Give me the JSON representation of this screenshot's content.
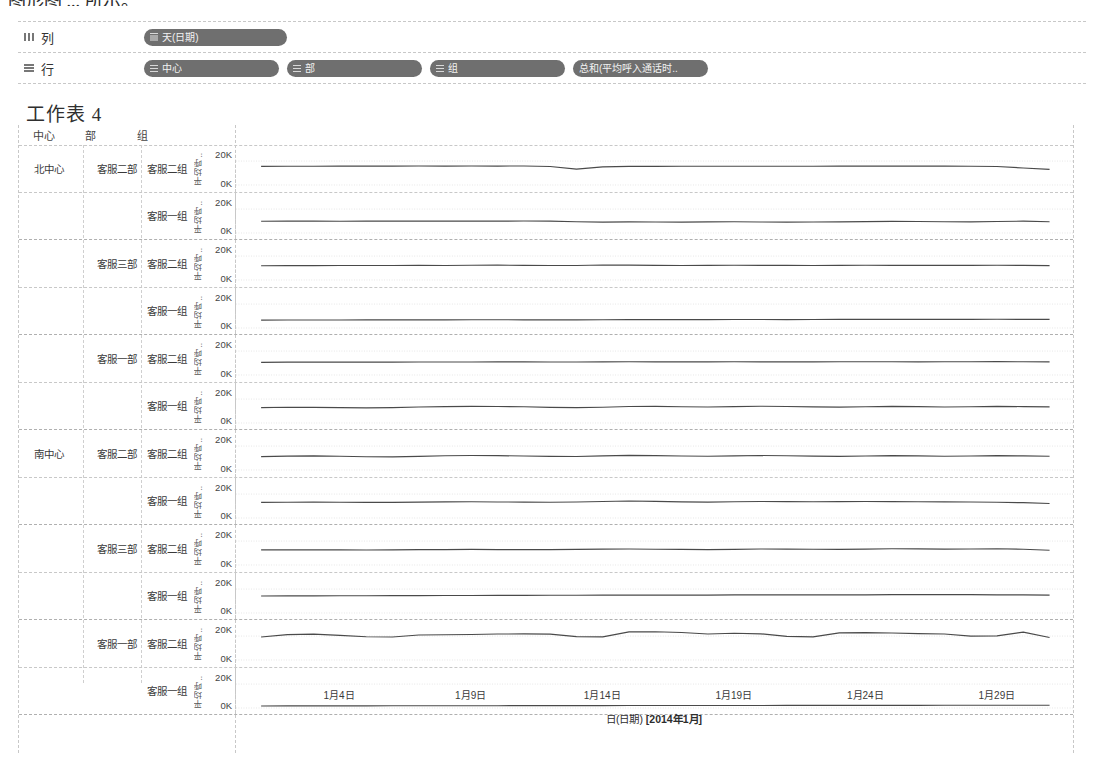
{
  "top_cut_text": "图形图 ... 所示。",
  "shelf": {
    "columns": {
      "label": "列",
      "icon": "columns-grid-icon",
      "pills": [
        {
          "icon": "calendar-icon",
          "text": "天(日期)"
        }
      ]
    },
    "rows": {
      "label": "行",
      "icon": "rows-grid-icon",
      "pills": [
        {
          "icon": "dimension-icon",
          "text": "中心"
        },
        {
          "icon": "dimension-icon",
          "text": "部"
        },
        {
          "icon": "dimension-icon",
          "text": "组"
        },
        {
          "icon": "measure-icon",
          "text": "总和(平均呼入通话时.."
        }
      ]
    }
  },
  "worksheet": {
    "title": "工作表 4"
  },
  "headers": {
    "center": "中心",
    "dept": "部",
    "group": "组"
  },
  "axis": {
    "y_title": "平均呼..",
    "y_ticks": [
      "20K",
      "0K"
    ],
    "x_ticks": [
      "1月4日",
      "1月9日",
      "1月14日",
      "1月19日",
      "1月24日",
      "1月29日"
    ],
    "x_title_main": "日(日期) ",
    "x_title_bold": "[2014年1月]"
  },
  "chart_data": {
    "type": "line",
    "title": "工作表 4",
    "xlabel": "日(日期) [2014年1月]",
    "ylabel": "平均呼入通话时长",
    "ylim": [
      0,
      28000
    ],
    "y_ticks": [
      0,
      20000
    ],
    "grid": true,
    "legend": "none",
    "x": [
      "1月1日",
      "1月2日",
      "1月3日",
      "1月4日",
      "1月5日",
      "1月6日",
      "1月7日",
      "1月8日",
      "1月9日",
      "1月10日",
      "1月11日",
      "1月12日",
      "1月13日",
      "1月14日",
      "1月15日",
      "1月16日",
      "1月17日",
      "1月18日",
      "1月19日",
      "1月20日",
      "1月21日",
      "1月22日",
      "1月23日",
      "1月24日",
      "1月25日",
      "1月26日",
      "1月27日",
      "1月28日",
      "1月29日",
      "1月30日",
      "1月31日"
    ],
    "panels": [
      {
        "center": "北中心",
        "dept": "客服二部",
        "group": "客服二组",
        "values": [
          15600,
          15700,
          15700,
          15750,
          15800,
          15800,
          15850,
          15800,
          15850,
          15800,
          15900,
          15500,
          13300,
          15200,
          15600,
          15600,
          15700,
          15700,
          15700,
          15700,
          15700,
          15700,
          15800,
          15800,
          15800,
          15800,
          15800,
          15700,
          15500,
          14200,
          13000
        ]
      },
      {
        "center": "北中心",
        "dept": "客服二部",
        "group": "客服一组",
        "values": [
          9800,
          9900,
          9900,
          9850,
          9900,
          9900,
          9950,
          9900,
          9900,
          9950,
          10000,
          9900,
          9400,
          9100,
          9300,
          9200,
          9100,
          9300,
          9400,
          9200,
          9100,
          9200,
          9300,
          9500,
          9700,
          9600,
          9400,
          9300,
          9600,
          9900,
          9400
        ]
      },
      {
        "center": "北中心",
        "dept": "客服三部",
        "group": "客服二组",
        "values": [
          11900,
          12000,
          12000,
          12100,
          12100,
          12150,
          12200,
          12150,
          12300,
          12400,
          12250,
          12150,
          12100,
          12500,
          12400,
          12200,
          12150,
          12200,
          12300,
          12250,
          12200,
          12150,
          12200,
          12300,
          12250,
          12200,
          12200,
          12250,
          12300,
          12200,
          12000
        ]
      },
      {
        "center": "北中心",
        "dept": "客服三部",
        "group": "客服一组",
        "values": [
          6600,
          6650,
          6700,
          6700,
          6750,
          6800,
          6800,
          6850,
          6900,
          6900,
          6850,
          6800,
          6800,
          6900,
          6950,
          7000,
          7000,
          7050,
          7100,
          7100,
          7050,
          7100,
          7150,
          7200,
          7200,
          7150,
          7200,
          7250,
          7300,
          7250,
          7200
        ]
      },
      {
        "center": "北中心",
        "dept": "客服一部",
        "group": "客服二组",
        "values": [
          10600,
          10700,
          10750,
          10750,
          10800,
          10800,
          10850,
          10900,
          10900,
          10950,
          11000,
          10900,
          10850,
          11000,
          11100,
          11000,
          10950,
          11000,
          11050,
          11000,
          10950,
          11000,
          11100,
          11100,
          11050,
          11000,
          11050,
          11100,
          11150,
          11100,
          11000
        ]
      },
      {
        "center": "北中心",
        "dept": "客服一部",
        "group": "客服一组",
        "values": [
          12800,
          13200,
          13100,
          12900,
          12700,
          12900,
          13400,
          13700,
          13900,
          13800,
          13600,
          13100,
          12900,
          13200,
          13800,
          13900,
          13600,
          13400,
          13700,
          14000,
          13800,
          13500,
          13300,
          13600,
          13900,
          13700,
          13400,
          13600,
          13900,
          13700,
          13500
        ]
      },
      {
        "center": "南中心",
        "dept": "客服二部",
        "group": "客服二组",
        "values": [
          11200,
          11600,
          11800,
          11500,
          11100,
          11000,
          11400,
          11900,
          12100,
          12000,
          11700,
          11400,
          11300,
          11800,
          12200,
          12000,
          11700,
          11500,
          11800,
          12100,
          11900,
          11600,
          11400,
          11700,
          12000,
          11800,
          11500,
          11700,
          12000,
          11800,
          11500
        ]
      },
      {
        "center": "南中心",
        "dept": "客服二部",
        "group": "客服一组",
        "values": [
          13000,
          13200,
          13300,
          13200,
          13100,
          13100,
          13300,
          13500,
          13600,
          13400,
          13300,
          13200,
          13400,
          13800,
          14200,
          13900,
          13500,
          13300,
          13600,
          13800,
          13700,
          13600,
          13700,
          13800,
          13700,
          13600,
          13500,
          13400,
          13200,
          12800,
          12100
        ]
      },
      {
        "center": "南中心",
        "dept": "客服三部",
        "group": "客服二组",
        "values": [
          12600,
          12700,
          12700,
          12600,
          12500,
          12600,
          12800,
          12900,
          13000,
          12900,
          12800,
          12900,
          13100,
          13300,
          13400,
          13200,
          13000,
          12900,
          13100,
          13400,
          13300,
          13200,
          13100,
          13300,
          13600,
          13500,
          13300,
          13400,
          13600,
          13200,
          12300
        ]
      },
      {
        "center": "南中心",
        "dept": "客服三部",
        "group": "客服一组",
        "values": [
          14200,
          14300,
          14300,
          14400,
          14400,
          14500,
          14500,
          14600,
          14600,
          14700,
          14700,
          14800,
          14800,
          14900,
          14900,
          15000,
          15000,
          15000,
          15100,
          15100,
          15100,
          15200,
          15200,
          15200,
          15300,
          15300,
          15300,
          15300,
          15200,
          15100,
          14900
        ]
      },
      {
        "center": "南中心",
        "dept": "客服一部",
        "group": "客服二组",
        "values": [
          19200,
          21200,
          21600,
          20600,
          19400,
          19200,
          20900,
          21100,
          21300,
          21700,
          21800,
          21600,
          19600,
          19300,
          23500,
          23600,
          23000,
          21700,
          22400,
          21900,
          19800,
          19300,
          22700,
          22900,
          22600,
          22000,
          21700,
          19900,
          20200,
          23300,
          18800
        ]
      },
      {
        "center": "南中心",
        "dept": "客服一部",
        "group": "客服一组",
        "values": [
          1700,
          1750,
          1750,
          1800,
          1800,
          1850,
          1850,
          1900,
          1900,
          1900,
          1950,
          1950,
          2000,
          2000,
          2050,
          2050,
          2050,
          2100,
          2100,
          2100,
          2150,
          2150,
          2150,
          2200,
          2200,
          2200,
          2250,
          2250,
          2250,
          2300,
          2300
        ]
      }
    ]
  }
}
